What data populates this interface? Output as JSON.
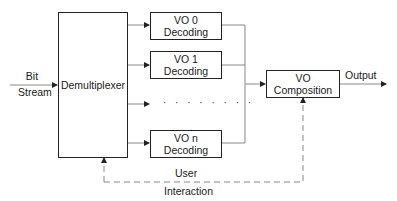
{
  "diagram": {
    "input_label": {
      "line1": "Bit",
      "line2": "Stream"
    },
    "demultiplexer": {
      "label": "Demultiplexer"
    },
    "decoders": [
      {
        "line1": "VO 0",
        "line2": "Decoding"
      },
      {
        "line1": "VO 1",
        "line2": "Decoding"
      },
      {
        "line1": "VO n",
        "line2": "Decoding"
      }
    ],
    "ellipsis": "· · · · · · · ·",
    "composition": {
      "line1": "VO",
      "line2": "Composition"
    },
    "output_label": "Output",
    "feedback_label": {
      "line1": "User",
      "line2": "Interaction"
    },
    "colors": {
      "box_border": "#222222",
      "connector": "#888888",
      "text": "#1a1a1a"
    }
  }
}
